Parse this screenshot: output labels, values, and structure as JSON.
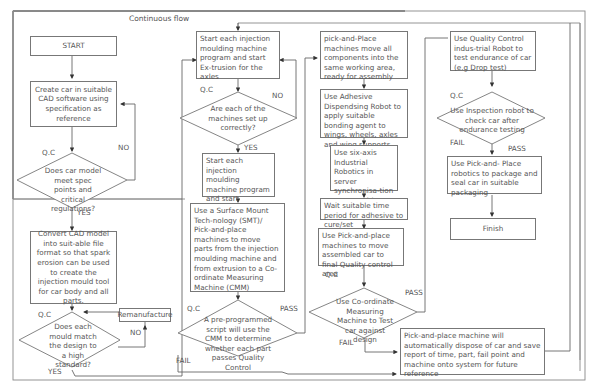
{
  "title": "Continuous flow",
  "column1": {
    "start": "START",
    "create_cad": "Create car in suitable CAD software using specification as reference",
    "qc1_label": "Q.C",
    "decision1": "Does car model meet spec points and critical regulations?",
    "no1": "NO",
    "yes1": "YES",
    "convert_cad": "Convert CAD model into suit-able file format so that spark erosion can be used to create the injection mould tool for car body and all parts.",
    "qc2_label": "Q.C",
    "decision2": "Does each mould match the design to a high standard?",
    "remanufacture": "Remanufacture",
    "no2": "NO",
    "yes2": "YES"
  },
  "column2": {
    "start_injection_1": "Start each injection moulding machine program and start Ex-trusion for the axles",
    "qc_label": "Q.C",
    "decision_setup": "Are each of the machines set up correctly?",
    "no": "NO",
    "yes": "YES",
    "start_injection_2": "Start each injection moulding machine program and start Extrusion for axles",
    "smt": "Use a Surface Mount Tech-nology (SMT)/ Pick-and-place machines to move parts from the injection moulding machine and from extrusion to a Co-ordinate Measuring Machine (CMM)",
    "qc2_label": "Q.C",
    "decision_cmm": "A pre-programmed script will use the CMM to determine whether each part passes Quality Control",
    "pass": "PASS",
    "fail": "FAIL"
  },
  "column3": {
    "pick_place_move": "pick-and-Place machines move all components into the same working area, ready for assembly",
    "adhesive": "Use Adhesive Dispendsing Robot to apply suitable bonding agent to wings, wheels, axles and wing supports",
    "six_axis": "Use six-axis Industrial Robotics in server synchronisa-tion to assemble car.",
    "wait": "Wait suitable time period for adhesive to cure/set",
    "move_final": "Use Pick-and-place machines to move assembled car to final Quality control area",
    "qc_label": "Q.C",
    "decision_cmm": "Use Co-ordinate Measuring Machine to Test car against design",
    "pass": "PASS",
    "fail": "FAIL",
    "dispose": "Pick-and-place machine will automatically dispose of car and save report of time, part, fail point and machine onto system for future reference"
  },
  "column4": {
    "endurance": "Use Quality Control indus-trial Robot to test endurance of car (e.g Drop test)",
    "qc_label": "Q.C",
    "decision_inspection": "Use Inspection robot to check car after endurance testing",
    "fail": "FAIL",
    "pass": "PASS",
    "package": "Use Pick-and- Place robotics to package and seal car in suitable packaging",
    "finish": "Finish"
  }
}
